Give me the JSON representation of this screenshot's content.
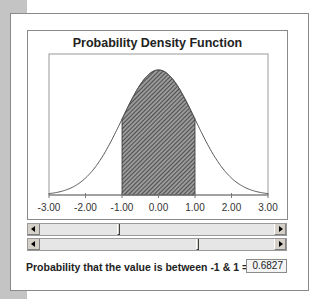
{
  "chart_data": {
    "type": "area",
    "title": "Probability Density Function",
    "xlabel": "",
    "ylabel": "",
    "xlim": [
      -3.0,
      3.0
    ],
    "ylim": [
      0,
      0.45
    ],
    "x_tick_labels": [
      "-3.00",
      "-2.00",
      "-1.00",
      "0.00",
      "1.00",
      "2.00",
      "3.00"
    ],
    "grid": false,
    "legend": null,
    "series": [
      {
        "name": "Standard normal density",
        "type": "line",
        "x": [
          -3.0,
          -2.5,
          -2.0,
          -1.5,
          -1.0,
          -0.5,
          0.0,
          0.5,
          1.0,
          1.5,
          2.0,
          2.5,
          3.0
        ],
        "values": [
          0.0044,
          0.0175,
          0.054,
          0.1295,
          0.242,
          0.3521,
          0.3989,
          0.3521,
          0.242,
          0.1295,
          0.054,
          0.0175,
          0.0044
        ]
      },
      {
        "name": "Shaded region",
        "type": "area",
        "x_range": [
          -1.0,
          1.0
        ],
        "fill": "hatched"
      }
    ],
    "annotation": "Probability that the value is between -1 & 1 = 0.6827"
  },
  "controls": {
    "lower_bound_slider": {
      "value": -1.0,
      "min": -3.0,
      "max": 3.0
    },
    "upper_bound_slider": {
      "value": 1.0,
      "min": -3.0,
      "max": 3.0
    }
  },
  "result": {
    "label": "Probability that the value is between -1 & 1 =",
    "value": "0.6827"
  },
  "colors": {
    "curve": "#555555",
    "hatch_dark": "#3a3a3a",
    "hatch_light": "#9a9a9a",
    "frame": "#8a8a8a",
    "side_strip": "#c4c4c4"
  }
}
